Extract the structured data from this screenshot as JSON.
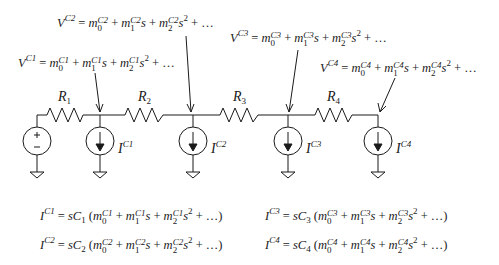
{
  "diagram": {
    "colors": {
      "stroke": "#1a1a1a",
      "background": "#ffffff"
    },
    "resistors": [
      {
        "name": "R",
        "sub": "1"
      },
      {
        "name": "R",
        "sub": "2"
      },
      {
        "name": "R",
        "sub": "3"
      },
      {
        "name": "R",
        "sub": "4"
      }
    ],
    "sources": {
      "voltage": {
        "plus": "+",
        "minus": "−"
      },
      "currents": [
        {
          "name": "I",
          "sup": "C1"
        },
        {
          "name": "I",
          "sup": "C2"
        },
        {
          "name": "I",
          "sup": "C3"
        },
        {
          "name": "I",
          "sup": "C4"
        }
      ]
    },
    "node_voltages": [
      {
        "lhs": "V",
        "sup": "C1",
        "eq": "=",
        "t0": "m",
        "t0_sup": "C1",
        "t0_sub": "0",
        "plus": "+",
        "t1": "m",
        "t1_sup": "C1",
        "t1_sub": "1",
        "s1": "s",
        "t2": "m",
        "t2_sup": "C1",
        "t2_sub": "2",
        "s2": "s",
        "s2_pow": "2",
        "tail": "+ …"
      },
      {
        "lhs": "V",
        "sup": "C2",
        "eq": "=",
        "t0": "m",
        "t0_sup": "C2",
        "t0_sub": "0",
        "plus": "+",
        "t1": "m",
        "t1_sup": "C2",
        "t1_sub": "1",
        "s1": "s",
        "t2": "m",
        "t2_sup": "C2",
        "t2_sub": "2",
        "s2": "s",
        "s2_pow": "2",
        "tail": "+ …"
      },
      {
        "lhs": "V",
        "sup": "C3",
        "eq": "=",
        "t0": "m",
        "t0_sup": "C3",
        "t0_sub": "0",
        "plus": "+",
        "t1": "m",
        "t1_sup": "C3",
        "t1_sub": "1",
        "s1": "s",
        "t2": "m",
        "t2_sup": "C3",
        "t2_sub": "2",
        "s2": "s",
        "s2_pow": "2",
        "tail": "+ …"
      },
      {
        "lhs": "V",
        "sup": "C4",
        "eq": "=",
        "t0": "m",
        "t0_sup": "C4",
        "t0_sub": "0",
        "plus": "+",
        "t1": "m",
        "t1_sup": "C4",
        "t1_sub": "1",
        "s1": "s",
        "t2": "m",
        "t2_sup": "C4",
        "t2_sub": "2",
        "s2": "s",
        "s2_pow": "2",
        "tail": "+ …"
      }
    ],
    "current_equations": [
      {
        "lhs": "I",
        "sup": "C1",
        "eq": "=",
        "pre": "sC",
        "pre_sub": "1",
        "open": "(",
        "t0_sup": "C1",
        "t1_sup": "C1",
        "t2_sup": "C1",
        "close": "+ …)"
      },
      {
        "lhs": "I",
        "sup": "C2",
        "eq": "=",
        "pre": "sC",
        "pre_sub": "2",
        "open": "(",
        "t0_sup": "C2",
        "t1_sup": "C2",
        "t2_sup": "C2",
        "close": "+ …)"
      },
      {
        "lhs": "I",
        "sup": "C3",
        "eq": "=",
        "pre": "sC",
        "pre_sub": "3",
        "open": "(",
        "t0_sup": "C3",
        "t1_sup": "C3",
        "t2_sup": "C3",
        "close": "+ …)"
      },
      {
        "lhs": "I",
        "sup": "C4",
        "eq": "=",
        "pre": "sC",
        "pre_sub": "4",
        "open": "(",
        "t0_sup": "C4",
        "t1_sup": "C4",
        "t2_sup": "C4",
        "close": "+ …)"
      }
    ],
    "common": {
      "m": "m",
      "s": "s",
      "plus": "+",
      "sub0": "0",
      "sub1": "1",
      "sub2": "2",
      "pow2": "2"
    }
  }
}
